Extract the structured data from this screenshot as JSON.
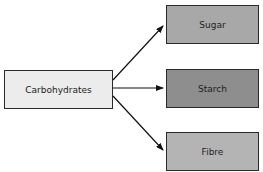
{
  "diagram": {
    "root": {
      "label": "Carbohydrates",
      "color": "#ececec"
    },
    "children": [
      {
        "label": "Sugar",
        "color": "#a8a8a8"
      },
      {
        "label": "Starch",
        "color": "#8e8e8e"
      },
      {
        "label": "Fibre",
        "color": "#b4b4b4"
      }
    ],
    "edges": [
      {
        "from": "Carbohydrates",
        "to": "Sugar"
      },
      {
        "from": "Carbohydrates",
        "to": "Starch"
      },
      {
        "from": "Carbohydrates",
        "to": "Fibre"
      }
    ]
  }
}
